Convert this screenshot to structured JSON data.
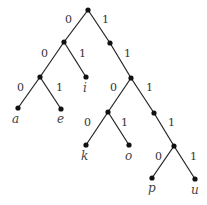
{
  "diagram": {
    "type": "binary-code-tree",
    "edge_labels": {
      "left": "0",
      "right": "1"
    },
    "leaves": [
      {
        "symbol": "a",
        "code": "000"
      },
      {
        "symbol": "e",
        "code": "001"
      },
      {
        "symbol": "i",
        "code": "01"
      },
      {
        "symbol": "k",
        "code": "1100"
      },
      {
        "symbol": "o",
        "code": "1101"
      },
      {
        "symbol": "p",
        "code": "11110"
      },
      {
        "symbol": "u",
        "code": "11111"
      }
    ]
  },
  "labels": {
    "root_l": "0",
    "root_r": "1",
    "n0_l": "0",
    "n0_r": "1",
    "n1_r": "1",
    "n00_l": "0",
    "n00_r": "1",
    "n11_l": "0",
    "n11_r": "1",
    "n110_l": "0",
    "n110_r": "1",
    "n111_r": "1",
    "n1111_l": "0",
    "n1111_r": "1",
    "leaf_a": "a",
    "leaf_e": "e",
    "leaf_i": "i",
    "leaf_k": "k",
    "leaf_o": "o",
    "leaf_p": "p",
    "leaf_u": "u"
  }
}
